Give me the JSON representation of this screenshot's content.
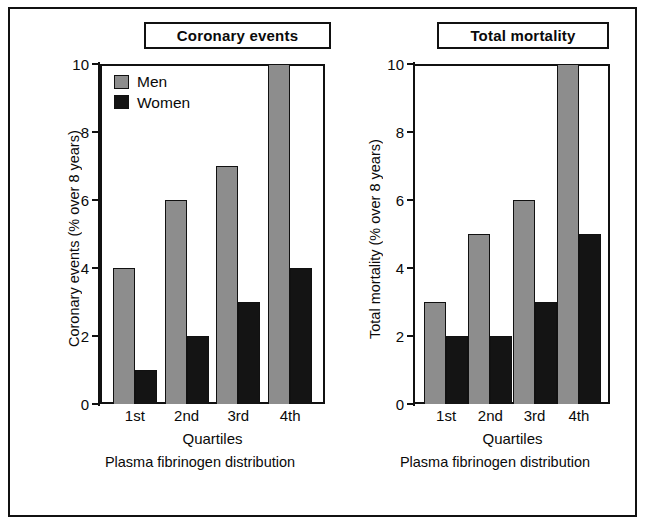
{
  "figure": {
    "panels": [
      {
        "id": "coronary-events",
        "title": "Coronary events",
        "ylabel": "Coronary events (% over 8 years)",
        "xlabel": "Quartiles",
        "caption": "Plasma fibrinogen distribution",
        "legend": [
          {
            "label": "Men",
            "color": "#8d8d8d"
          },
          {
            "label": "Women",
            "color": "#141414"
          }
        ]
      },
      {
        "id": "total-mortality",
        "title": "Total mortality",
        "ylabel": "Total mortality (% over 8 years)",
        "xlabel": "Quartiles",
        "caption": "Plasma fibrinogen distribution",
        "legend": []
      }
    ]
  },
  "chart_data": [
    {
      "type": "bar",
      "title": "Coronary events",
      "categories": [
        "1st",
        "2nd",
        "3rd",
        "4th"
      ],
      "series": [
        {
          "name": "Men",
          "values": [
            4,
            6,
            7,
            10
          ],
          "color": "#8d8d8d"
        },
        {
          "name": "Women",
          "values": [
            1,
            2,
            3,
            4
          ],
          "color": "#141414"
        }
      ],
      "xlabel": "Quartiles",
      "ylabel": "Coronary events (% over 8 years)",
      "caption": "Plasma fibrinogen distribution",
      "ylim": [
        0,
        10
      ],
      "yticks": [
        0,
        2,
        4,
        6,
        8,
        10
      ],
      "grid": false,
      "legend_position": "top-left"
    },
    {
      "type": "bar",
      "title": "Total mortality",
      "categories": [
        "1st",
        "2nd",
        "3rd",
        "4th"
      ],
      "series": [
        {
          "name": "Men",
          "values": [
            3,
            5,
            6,
            10
          ],
          "color": "#8d8d8d"
        },
        {
          "name": "Women",
          "values": [
            2,
            2,
            3,
            5
          ],
          "color": "#141414"
        }
      ],
      "xlabel": "Quartiles",
      "ylabel": "Total mortality (% over 8 years)",
      "caption": "Plasma fibrinogen distribution",
      "ylim": [
        0,
        10
      ],
      "yticks": [
        0,
        2,
        4,
        6,
        8,
        10
      ],
      "grid": false,
      "legend_position": "none"
    }
  ]
}
